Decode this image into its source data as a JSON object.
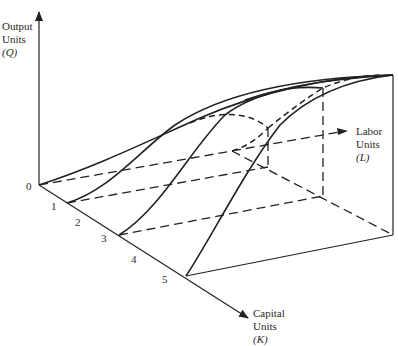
{
  "axes": {
    "q": {
      "line1": "Output",
      "line2": "Units",
      "line3": "(Q)"
    },
    "l": {
      "line1": "Labor",
      "line2": "Units",
      "line3": "(L)"
    },
    "k": {
      "line1": "Capital",
      "line2": "Units",
      "line3": "(K)"
    }
  },
  "ticks": {
    "origin": "0",
    "k": [
      "1",
      "2",
      "3",
      "4",
      "5"
    ]
  },
  "colors": {
    "ink": "#222222",
    "background": "#ffffff"
  }
}
